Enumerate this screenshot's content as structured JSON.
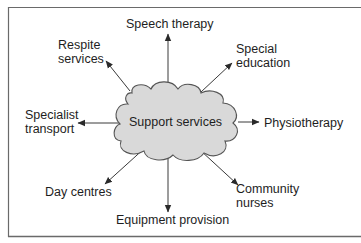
{
  "diagram": {
    "center": {
      "label": "Support services"
    },
    "nodes": [
      {
        "id": "speech",
        "lines": [
          "Speech therapy"
        ]
      },
      {
        "id": "special-education",
        "lines": [
          "Special",
          "education"
        ]
      },
      {
        "id": "physiotherapy",
        "lines": [
          "Physiotherapy"
        ]
      },
      {
        "id": "community-nurses",
        "lines": [
          "Community",
          "nurses"
        ]
      },
      {
        "id": "equipment",
        "lines": [
          "Equipment provision"
        ]
      },
      {
        "id": "day-centres",
        "lines": [
          "Day centres"
        ]
      },
      {
        "id": "specialist-transport",
        "lines": [
          "Specialist",
          "transport"
        ]
      },
      {
        "id": "respite",
        "lines": [
          "Respite",
          "services"
        ]
      }
    ],
    "edges": [
      {
        "from": "Support services",
        "to": "Speech therapy"
      },
      {
        "from": "Support services",
        "to": "Special education"
      },
      {
        "from": "Support services",
        "to": "Physiotherapy"
      },
      {
        "from": "Support services",
        "to": "Community nurses"
      },
      {
        "from": "Support services",
        "to": "Equipment provision"
      },
      {
        "from": "Support services",
        "to": "Day centres"
      },
      {
        "from": "Support services",
        "to": "Specialist transport"
      },
      {
        "from": "Support services",
        "to": "Respite services"
      }
    ],
    "colors": {
      "cloud_fill": "#d9d9d9",
      "cloud_stroke": "#555555",
      "arrow": "#333333",
      "frame": "#666666",
      "text": "#1e1e1e"
    }
  }
}
